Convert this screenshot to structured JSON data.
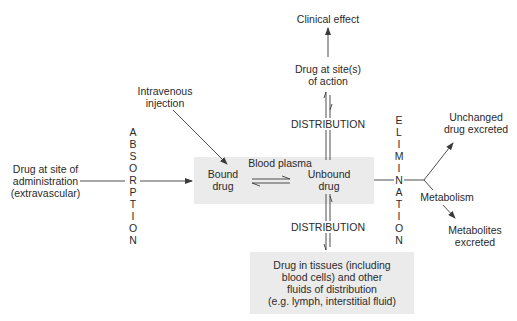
{
  "diagram": {
    "nodes": {
      "clinical_effect": "Clinical effect",
      "site_of_action": "Drug at site(s)\nof action",
      "intravenous": "Intravenous\ninjection",
      "site_of_administration": "Drug at site of\nadministration\n(extravascular)",
      "blood_plasma": "Blood plasma",
      "bound_drug": "Bound\ndrug",
      "unbound_drug": "Unbound\ndrug",
      "tissues": "Drug in tissues (including\nblood cells) and other\nfluids of distribution\n(e.g. lymph, interstitial fluid)",
      "unchanged_excreted": "Unchanged\ndrug excreted",
      "metabolism": "Metabolism",
      "metabolites_excreted": "Metabolites\nexcreted"
    },
    "process_labels": {
      "absorption": "A\nB\nS\nO\nR\nP\nT\nI\nO\nN",
      "elimination": "E\nL\nI\nM\nI\nN\nA\nT\nI\nO\nN",
      "distribution_upper": "DISTRIBUTION",
      "distribution_lower": "DISTRIBUTION"
    },
    "colors": {
      "box_fill": "#ebebeb",
      "line": "#3a3a3a",
      "text": "#2a2a2a"
    }
  }
}
